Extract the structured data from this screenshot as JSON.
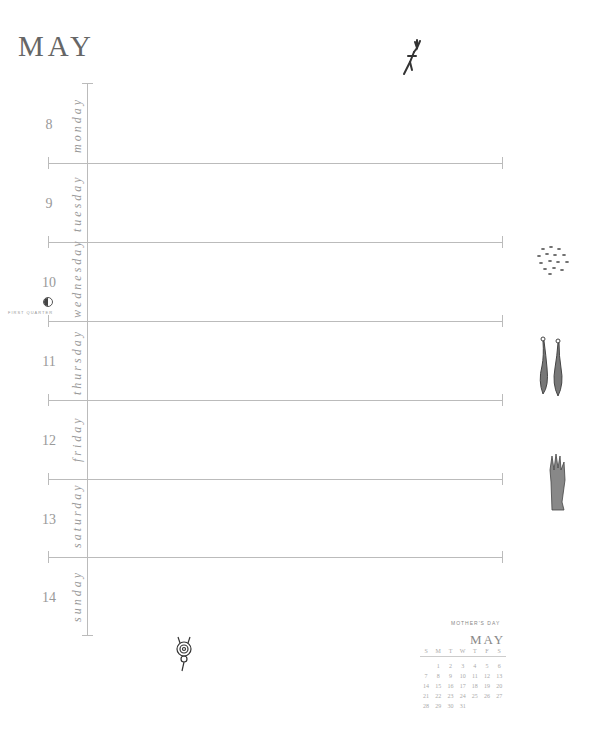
{
  "page": {
    "month_title": "MAY"
  },
  "days": [
    {
      "num": "8",
      "name": "monday"
    },
    {
      "num": "9",
      "name": "tuesday"
    },
    {
      "num": "10",
      "name": "wednesday"
    },
    {
      "num": "11",
      "name": "thursday"
    },
    {
      "num": "12",
      "name": "friday"
    },
    {
      "num": "13",
      "name": "saturday"
    },
    {
      "num": "14",
      "name": "sunday"
    }
  ],
  "moon_phase": {
    "label": "FIRST QUARTER",
    "icon": "first-quarter-moon-icon"
  },
  "mini_calendar": {
    "note": "MOTHER'S DAY",
    "month": "MAY",
    "weekdays": [
      "S",
      "M",
      "T",
      "W",
      "T",
      "F",
      "S"
    ],
    "weeks": [
      [
        "",
        "1",
        "2",
        "3",
        "4",
        "5",
        "6"
      ],
      [
        "7",
        "8",
        "9",
        "10",
        "11",
        "12",
        "13"
      ],
      [
        "14",
        "15",
        "16",
        "17",
        "18",
        "19",
        "20"
      ],
      [
        "21",
        "22",
        "23",
        "24",
        "25",
        "26",
        "27"
      ],
      [
        "28",
        "29",
        "30",
        "31",
        "",
        "",
        ""
      ]
    ]
  },
  "illustrations": [
    "running-figure-icon",
    "seeds-cluster-icon",
    "two-gourds-icon",
    "raised-hand-icon",
    "spiral-creature-icon"
  ]
}
